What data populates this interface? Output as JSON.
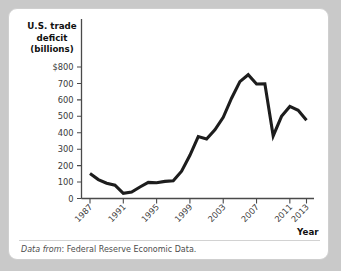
{
  "panel": {
    "background_color": "#ffffff",
    "border_color": "#cfcfcf",
    "page_background_color": "#c9c9c9"
  },
  "axis_titles": {
    "y_line1": "U.S. trade",
    "y_line2": "deficit",
    "y_line3": "(billions)",
    "x": "Year"
  },
  "caption": {
    "prefix": "Data from",
    "separator": ": ",
    "text": "Federal Reserve Economic Data."
  },
  "chart_data": {
    "type": "line",
    "title": "U.S. trade deficit (billions)",
    "xlabel": "Year",
    "ylabel": "U.S. trade deficit (billions)",
    "xlim": [
      1987,
      2013
    ],
    "ylim": [
      0,
      800
    ],
    "grid": false,
    "legend": "none",
    "line_color": "#1d1d1d",
    "y_ticks": [
      0,
      100,
      200,
      300,
      400,
      500,
      600,
      700,
      800
    ],
    "y_tick_labels": [
      "0",
      "100",
      "200",
      "300",
      "400",
      "500",
      "600",
      "700",
      "$800"
    ],
    "x_ticks": [
      1987,
      1991,
      1995,
      1999,
      2003,
      2007,
      2011,
      2013
    ],
    "x_tick_labels": [
      "1987",
      "1991",
      "1995",
      "1999",
      "2003",
      "2007",
      "2011",
      "2013"
    ],
    "x": [
      1987,
      1988,
      1989,
      1990,
      1991,
      1992,
      1993,
      1994,
      1995,
      1996,
      1997,
      1998,
      1999,
      2000,
      2001,
      2002,
      2003,
      2004,
      2005,
      2006,
      2007,
      2008,
      2009,
      2010,
      2011,
      2012,
      2013
    ],
    "values": [
      152,
      115,
      93,
      81,
      31,
      39,
      70,
      98,
      96,
      104,
      108,
      166,
      263,
      377,
      362,
      418,
      494,
      610,
      711,
      753,
      697,
      698,
      381,
      500,
      560,
      537,
      476
    ],
    "series": [
      {
        "name": "U.S. trade deficit",
        "values": [
          152,
          115,
          93,
          81,
          31,
          39,
          70,
          98,
          96,
          104,
          108,
          166,
          263,
          377,
          362,
          418,
          494,
          610,
          711,
          753,
          697,
          698,
          381,
          500,
          560,
          537,
          476
        ]
      }
    ],
    "annotations": []
  }
}
